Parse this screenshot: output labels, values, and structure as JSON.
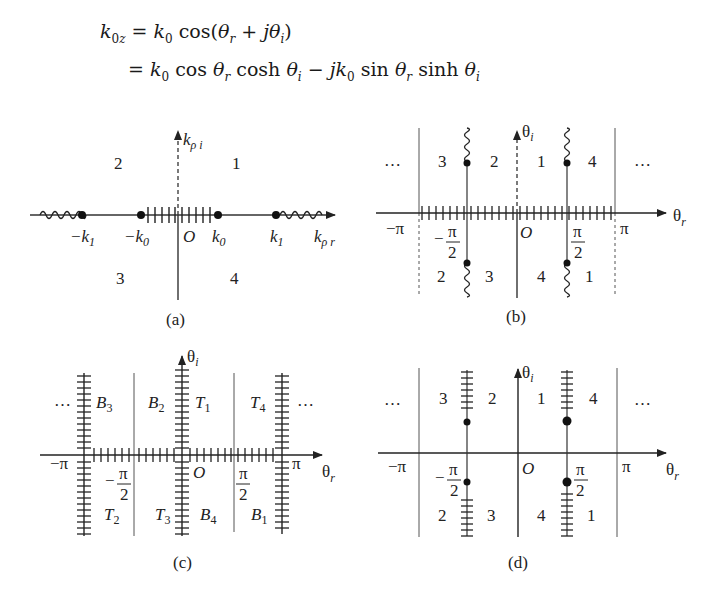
{
  "equation": {
    "line1": {
      "lhs": "k₀z",
      "rhs": "= k₀ cos(θᵣ + jθᵢ)"
    },
    "line2": {
      "rhs": "= k₀ cos θᵣ cosh θᵢ − jk₀ sin θᵣ sinh θᵢ"
    }
  },
  "panels": {
    "a": {
      "caption": "(a)",
      "axis_x_label": "kρr",
      "axis_y_label": "kρi",
      "origin": "O",
      "points": [
        "−k₁",
        "−k₀",
        "k₀",
        "k₁"
      ],
      "regions": [
        "2",
        "1",
        "3",
        "4"
      ]
    },
    "b": {
      "caption": "(b)",
      "axis_x_label": "θr",
      "axis_y_label": "θi",
      "origin": "O",
      "ticks": [
        "−π",
        "−π/2",
        "π/2",
        "π"
      ],
      "ellipsis": "…",
      "regions_top": [
        "3",
        "2",
        "1",
        "4"
      ],
      "regions_bottom": [
        "2",
        "3",
        "4",
        "1"
      ]
    },
    "c": {
      "caption": "(c)",
      "axis_x_label": "θr",
      "axis_y_label": "θi",
      "origin": "O",
      "ticks": [
        "−π",
        "−π/2",
        "π/2",
        "π"
      ],
      "ellipsis": "…",
      "regions_top": [
        "B₃",
        "B₂",
        "T₁",
        "T₄"
      ],
      "regions_bottom": [
        "T₂",
        "T₃",
        "B₄",
        "B₁"
      ]
    },
    "d": {
      "caption": "(d)",
      "axis_x_label": "θr",
      "axis_y_label": "θi",
      "origin": "O",
      "ticks": [
        "−π",
        "−π/2",
        "π/2",
        "π"
      ],
      "ellipsis": "…",
      "regions_top": [
        "3",
        "2",
        "1",
        "4"
      ],
      "regions_bottom": [
        "2",
        "3",
        "4",
        "1"
      ]
    }
  }
}
